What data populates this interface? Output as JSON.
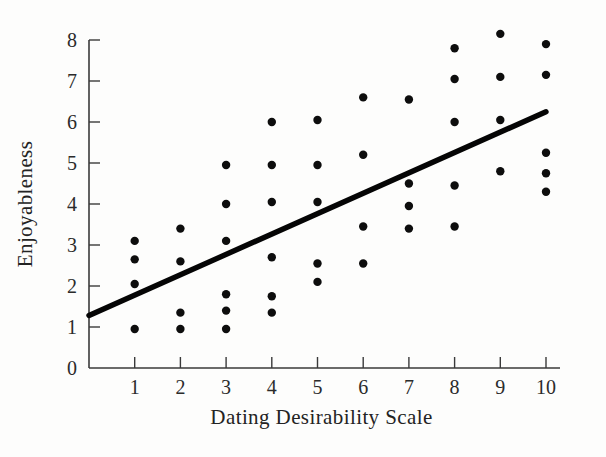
{
  "chart_data": {
    "type": "scatter",
    "title": "",
    "xlabel": "Dating Desirability Scale",
    "ylabel": "Enjoyableness",
    "xlim": [
      0,
      10
    ],
    "ylim": [
      0,
      8
    ],
    "xticks": [
      "0",
      "1",
      "2",
      "3",
      "4",
      "5",
      "6",
      "7",
      "8",
      "9",
      "10"
    ],
    "yticks": [
      "0",
      "1",
      "2",
      "3",
      "4",
      "5",
      "6",
      "7",
      "8"
    ],
    "grid": false,
    "legend": null,
    "marker": {
      "shape": "circle",
      "color": "#0d0d0d",
      "radius_px": 4.2
    },
    "points": [
      {
        "x": 1,
        "y": 3.1
      },
      {
        "x": 1,
        "y": 2.65
      },
      {
        "x": 1,
        "y": 2.05
      },
      {
        "x": 1,
        "y": 0.95
      },
      {
        "x": 2,
        "y": 3.4
      },
      {
        "x": 2,
        "y": 2.6
      },
      {
        "x": 2,
        "y": 1.35
      },
      {
        "x": 2,
        "y": 0.95
      },
      {
        "x": 3,
        "y": 4.95
      },
      {
        "x": 3,
        "y": 4.0
      },
      {
        "x": 3,
        "y": 3.1
      },
      {
        "x": 3,
        "y": 1.8
      },
      {
        "x": 3,
        "y": 1.4
      },
      {
        "x": 3,
        "y": 0.95
      },
      {
        "x": 4,
        "y": 6.0
      },
      {
        "x": 4,
        "y": 4.95
      },
      {
        "x": 4,
        "y": 4.05
      },
      {
        "x": 4,
        "y": 2.7
      },
      {
        "x": 4,
        "y": 1.75
      },
      {
        "x": 4,
        "y": 1.35
      },
      {
        "x": 5,
        "y": 6.05
      },
      {
        "x": 5,
        "y": 4.95
      },
      {
        "x": 5,
        "y": 4.05
      },
      {
        "x": 5,
        "y": 2.55
      },
      {
        "x": 5,
        "y": 2.1
      },
      {
        "x": 6,
        "y": 6.6
      },
      {
        "x": 6,
        "y": 5.2
      },
      {
        "x": 6,
        "y": 3.45
      },
      {
        "x": 6,
        "y": 2.55
      },
      {
        "x": 7,
        "y": 6.55
      },
      {
        "x": 7,
        "y": 4.5
      },
      {
        "x": 7,
        "y": 3.95
      },
      {
        "x": 7,
        "y": 3.4
      },
      {
        "x": 8,
        "y": 7.8
      },
      {
        "x": 8,
        "y": 7.05
      },
      {
        "x": 8,
        "y": 6.0
      },
      {
        "x": 8,
        "y": 4.45
      },
      {
        "x": 8,
        "y": 3.45
      },
      {
        "x": 9,
        "y": 8.15
      },
      {
        "x": 9,
        "y": 7.1
      },
      {
        "x": 9,
        "y": 6.05
      },
      {
        "x": 9,
        "y": 4.8
      },
      {
        "x": 10,
        "y": 7.9
      },
      {
        "x": 10,
        "y": 7.15
      },
      {
        "x": 10,
        "y": 5.25
      },
      {
        "x": 10,
        "y": 4.75
      },
      {
        "x": 10,
        "y": 4.3
      }
    ],
    "trendline": {
      "type": "linear-regression",
      "x_start": 0,
      "y_start": 1.28,
      "x_end": 10,
      "y_end": 6.25,
      "color": "#050505"
    }
  },
  "colors": {
    "background": "#fdfdfc",
    "axis": "#3a3a3a",
    "text": "#2b2b2b",
    "marker": "#0d0d0d",
    "trendline": "#050505"
  }
}
